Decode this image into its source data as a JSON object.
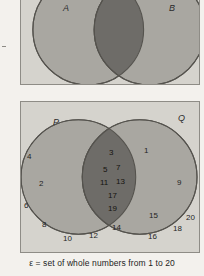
{
  "figure_top": {
    "name": "venn-two-sets-shaded-intersection",
    "set_left_label": "A",
    "set_right_label": "B",
    "fill_circle": "#a9a7a1",
    "fill_intersection": "#6e6c68",
    "fill_background": "#d5d3cd",
    "stroke": "#55534e"
  },
  "figure_bottom": {
    "name": "venn-primes-odd-numbers",
    "set_left_label": "P",
    "set_right_label": "Q",
    "fill_circle": "#a9a7a1",
    "fill_intersection": "#6e6c68",
    "fill_background": "#d5d3cd",
    "stroke": "#55534e",
    "members_left_only": [
      "2",
      "8"
    ],
    "members_intersection": [
      "3",
      "5",
      "7",
      "11",
      "13",
      "17",
      "19"
    ],
    "members_right_only": [
      "1",
      "9",
      "15"
    ],
    "members_outside": [
      "4",
      "6",
      "10",
      "12",
      "14",
      "16",
      "18",
      "20"
    ],
    "placed_numbers": [
      {
        "text": "4",
        "x": 6,
        "y": 51,
        "zone": "outside"
      },
      {
        "text": "2",
        "x": 18,
        "y": 78,
        "zone": "left-only"
      },
      {
        "text": "6",
        "x": 3,
        "y": 100,
        "zone": "outside"
      },
      {
        "text": "8",
        "x": 21,
        "y": 119,
        "zone": "left-only"
      },
      {
        "text": "10",
        "x": 42,
        "y": 133,
        "zone": "outside"
      },
      {
        "text": "12",
        "x": 68,
        "y": 130,
        "zone": "outside"
      },
      {
        "text": "14",
        "x": 91,
        "y": 122,
        "zone": "outside"
      },
      {
        "text": "3",
        "x": 88,
        "y": 47,
        "zone": "intersection"
      },
      {
        "text": "5",
        "x": 82,
        "y": 64,
        "zone": "intersection"
      },
      {
        "text": "7",
        "x": 95,
        "y": 62,
        "zone": "intersection"
      },
      {
        "text": "11",
        "x": 79,
        "y": 77,
        "zone": "intersection"
      },
      {
        "text": "13",
        "x": 95,
        "y": 76,
        "zone": "intersection"
      },
      {
        "text": "17",
        "x": 87,
        "y": 90,
        "zone": "intersection"
      },
      {
        "text": "19",
        "x": 87,
        "y": 103,
        "zone": "intersection"
      },
      {
        "text": "1",
        "x": 123,
        "y": 45,
        "zone": "right-only"
      },
      {
        "text": "9",
        "x": 156,
        "y": 77,
        "zone": "right-only"
      },
      {
        "text": "15",
        "x": 128,
        "y": 110,
        "zone": "right-only"
      },
      {
        "text": "18",
        "x": 152,
        "y": 123,
        "zone": "outside"
      },
      {
        "text": "20",
        "x": 165,
        "y": 112,
        "zone": "outside"
      },
      {
        "text": "16",
        "x": 127,
        "y": 131,
        "zone": "outside"
      }
    ]
  },
  "caption": {
    "text": "ε = set of whole numbers from 1 to 20"
  }
}
